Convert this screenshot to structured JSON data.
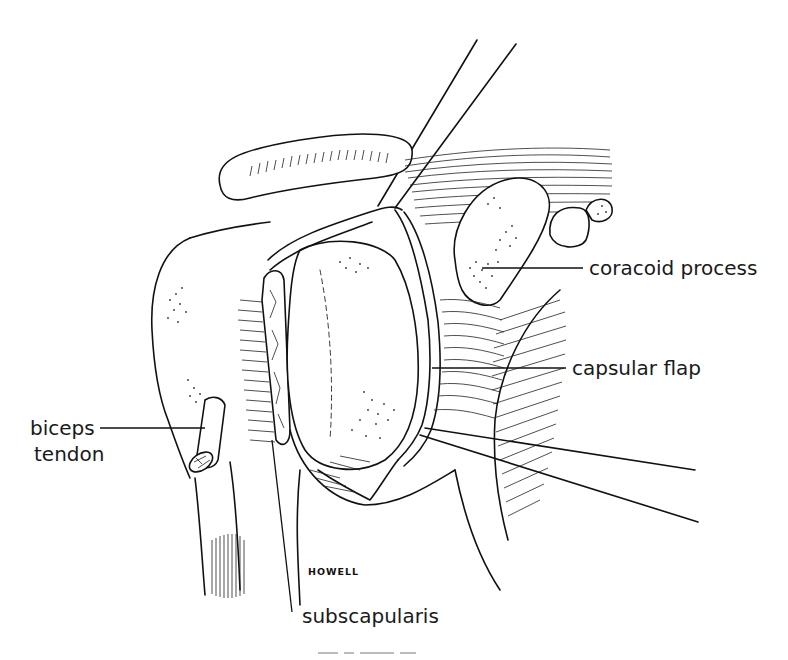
{
  "figure": {
    "type": "anatomical line illustration",
    "colors": {
      "ink": "#111111",
      "background": "#ffffff"
    }
  },
  "labels": {
    "coracoid_process": "coracoid process",
    "capsular_flap": "capsular flap",
    "biceps_tendon_line1": "biceps",
    "biceps_tendon_line2": "tendon",
    "subscapularis": "subscapularis"
  },
  "signature": "HOWELL"
}
